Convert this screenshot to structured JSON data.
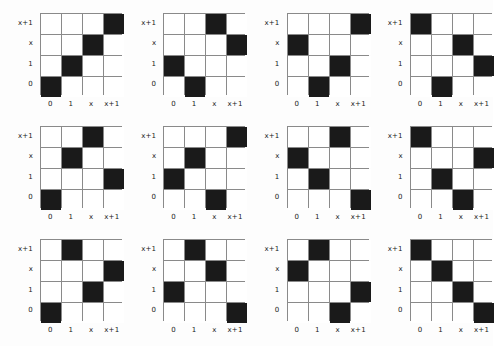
{
  "figure": {
    "title": "",
    "rows": 3,
    "cols": 4,
    "panel_count": 12,
    "colors": {
      "filled_cell": "#1a1a1a",
      "empty_cell": "#ffffff",
      "grid_line": "#8a8a8a",
      "background": "#fdfdfd",
      "label_text": "#1a1a1a"
    }
  },
  "chart_data": {
    "type": "heatmap",
    "title": "",
    "xlabel": "",
    "ylabel": "",
    "grid": true,
    "legend_position": "none",
    "x_tick_labels": [
      "0",
      "1",
      "x",
      "x+1"
    ],
    "y_tick_labels": [
      "x+1",
      "x",
      "1",
      "0"
    ],
    "x_categories": [
      "0",
      "1",
      "x",
      "x+1"
    ],
    "y_categories_top_to_bottom": [
      "x+1",
      "x",
      "1",
      "0"
    ],
    "value_filled": 1,
    "value_empty": 0,
    "panels": [
      {
        "index": 1,
        "mapping": {
          "x+1": "x+1",
          "x": "x",
          "1": "1",
          "0": "0"
        },
        "matrix_top_to_bottom": [
          [
            0,
            0,
            0,
            1
          ],
          [
            0,
            0,
            1,
            0
          ],
          [
            0,
            1,
            0,
            0
          ],
          [
            1,
            0,
            0,
            0
          ]
        ]
      },
      {
        "index": 2,
        "mapping": {
          "x+1": "x",
          "x": "x+1",
          "1": "0",
          "0": "1"
        },
        "matrix_top_to_bottom": [
          [
            0,
            0,
            1,
            0
          ],
          [
            0,
            0,
            0,
            1
          ],
          [
            1,
            0,
            0,
            0
          ],
          [
            0,
            1,
            0,
            0
          ]
        ]
      },
      {
        "index": 3,
        "mapping": {
          "x+1": "x+1",
          "x": "0",
          "1": "x",
          "0": "1"
        },
        "matrix_top_to_bottom": [
          [
            0,
            0,
            0,
            1
          ],
          [
            1,
            0,
            0,
            0
          ],
          [
            0,
            0,
            1,
            0
          ],
          [
            0,
            1,
            0,
            0
          ]
        ]
      },
      {
        "index": 4,
        "mapping": {
          "x+1": "0",
          "x": "x",
          "1": "x+1",
          "0": "1"
        },
        "matrix_top_to_bottom": [
          [
            1,
            0,
            0,
            0
          ],
          [
            0,
            0,
            1,
            0
          ],
          [
            0,
            0,
            0,
            1
          ],
          [
            0,
            1,
            0,
            0
          ]
        ]
      },
      {
        "index": 5,
        "mapping": {
          "x+1": "x",
          "x": "1",
          "1": "x+1",
          "0": "0"
        },
        "matrix_top_to_bottom": [
          [
            0,
            0,
            1,
            0
          ],
          [
            0,
            1,
            0,
            0
          ],
          [
            0,
            0,
            0,
            1
          ],
          [
            1,
            0,
            0,
            0
          ]
        ]
      },
      {
        "index": 6,
        "mapping": {
          "x+1": "x+1",
          "x": "1",
          "1": "0",
          "0": "x"
        },
        "matrix_top_to_bottom": [
          [
            0,
            0,
            0,
            1
          ],
          [
            0,
            1,
            0,
            0
          ],
          [
            1,
            0,
            0,
            0
          ],
          [
            0,
            0,
            1,
            0
          ]
        ]
      },
      {
        "index": 7,
        "mapping": {
          "x+1": "x",
          "x": "0",
          "1": "1",
          "0": "x+1"
        },
        "matrix_top_to_bottom": [
          [
            0,
            0,
            1,
            0
          ],
          [
            1,
            0,
            0,
            0
          ],
          [
            0,
            1,
            0,
            0
          ],
          [
            0,
            0,
            0,
            1
          ]
        ]
      },
      {
        "index": 8,
        "mapping": {
          "x+1": "0",
          "x": "x+1",
          "1": "1",
          "0": "x"
        },
        "matrix_top_to_bottom": [
          [
            1,
            0,
            0,
            0
          ],
          [
            0,
            0,
            0,
            1
          ],
          [
            0,
            1,
            0,
            0
          ],
          [
            0,
            0,
            1,
            0
          ]
        ]
      },
      {
        "index": 9,
        "mapping": {
          "x+1": "1",
          "x": "x+1",
          "1": "x",
          "0": "0"
        },
        "matrix_top_to_bottom": [
          [
            0,
            1,
            0,
            0
          ],
          [
            0,
            0,
            0,
            1
          ],
          [
            0,
            0,
            1,
            0
          ],
          [
            1,
            0,
            0,
            0
          ]
        ]
      },
      {
        "index": 10,
        "mapping": {
          "x+1": "1",
          "x": "x",
          "1": "0",
          "0": "x+1"
        },
        "matrix_top_to_bottom": [
          [
            0,
            1,
            0,
            0
          ],
          [
            0,
            0,
            1,
            0
          ],
          [
            1,
            0,
            0,
            0
          ],
          [
            0,
            0,
            0,
            1
          ]
        ]
      },
      {
        "index": 11,
        "mapping": {
          "x+1": "1",
          "x": "0",
          "1": "x+1",
          "0": "x"
        },
        "matrix_top_to_bottom": [
          [
            0,
            1,
            0,
            0
          ],
          [
            1,
            0,
            0,
            0
          ],
          [
            0,
            0,
            0,
            1
          ],
          [
            0,
            0,
            1,
            0
          ]
        ]
      },
      {
        "index": 12,
        "mapping": {
          "x+1": "0",
          "x": "1",
          "1": "x",
          "0": "x+1"
        },
        "matrix_top_to_bottom": [
          [
            1,
            0,
            0,
            0
          ],
          [
            0,
            1,
            0,
            0
          ],
          [
            0,
            0,
            1,
            0
          ],
          [
            0,
            0,
            0,
            1
          ]
        ]
      }
    ]
  }
}
